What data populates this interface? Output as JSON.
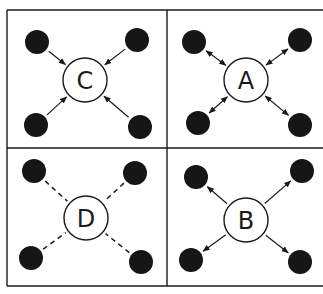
{
  "diagram": {
    "type": "network-topology-comparison",
    "colors": {
      "border": "#1a1a1a",
      "node_fill": "#161616",
      "hub_fill": "#ffffff",
      "background": "#ffffff"
    },
    "panels": [
      {
        "id": "C",
        "label": "C",
        "position": "top-left",
        "edge_style": "arrow-inward",
        "hub": {
          "cx": 85,
          "cy": 80,
          "r": 22
        },
        "nodes": [
          {
            "cx": 37,
            "cy": 42
          },
          {
            "cx": 137,
            "cy": 40
          },
          {
            "cx": 36,
            "cy": 125
          },
          {
            "cx": 140,
            "cy": 127
          }
        ]
      },
      {
        "id": "A",
        "label": "A",
        "position": "top-right",
        "edge_style": "arrow-both",
        "hub": {
          "cx": 246,
          "cy": 80,
          "r": 22
        },
        "nodes": [
          {
            "cx": 194,
            "cy": 42
          },
          {
            "cx": 300,
            "cy": 40
          },
          {
            "cx": 198,
            "cy": 123
          },
          {
            "cx": 300,
            "cy": 125
          }
        ]
      },
      {
        "id": "D",
        "label": "D",
        "position": "bottom-left",
        "edge_style": "dashed",
        "hub": {
          "cx": 86,
          "cy": 218,
          "r": 22
        },
        "nodes": [
          {
            "cx": 34,
            "cy": 171
          },
          {
            "cx": 135,
            "cy": 173
          },
          {
            "cx": 31,
            "cy": 258
          },
          {
            "cx": 141,
            "cy": 262
          }
        ]
      },
      {
        "id": "B",
        "label": "B",
        "position": "bottom-right",
        "edge_style": "arrow-outward",
        "hub": {
          "cx": 246,
          "cy": 220,
          "r": 22
        },
        "nodes": [
          {
            "cx": 196,
            "cy": 177
          },
          {
            "cx": 302,
            "cy": 171
          },
          {
            "cx": 191,
            "cy": 260
          },
          {
            "cx": 300,
            "cy": 262
          }
        ]
      }
    ],
    "node_radius": 12
  }
}
